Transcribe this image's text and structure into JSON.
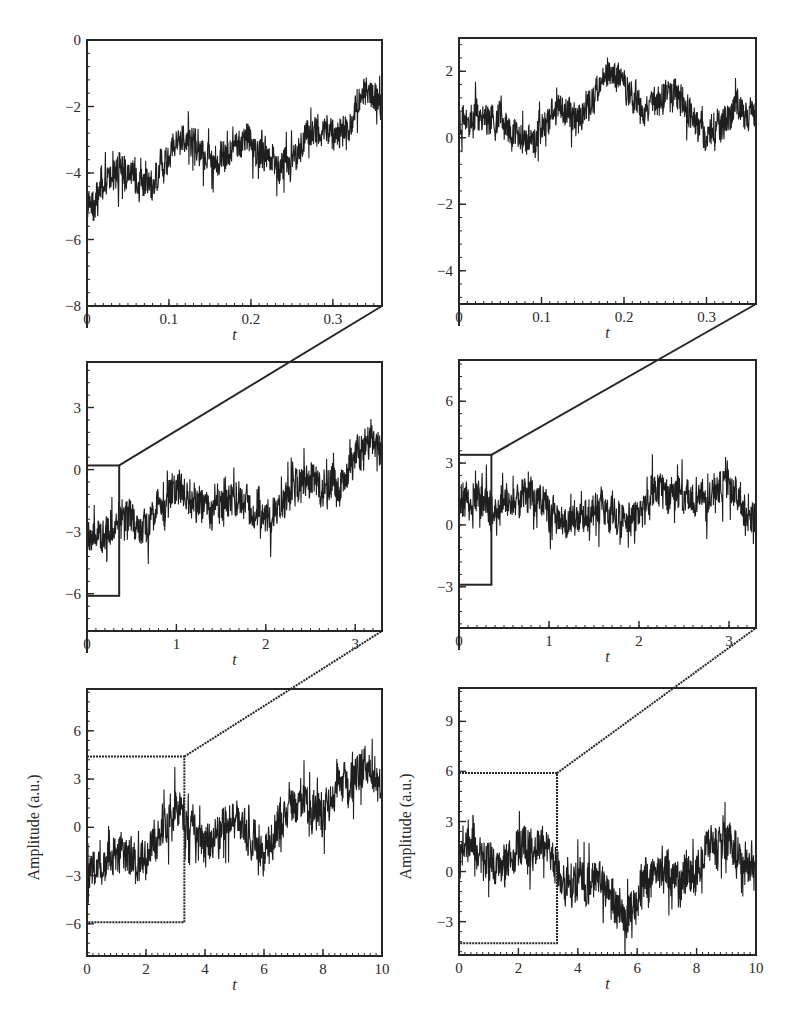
{
  "figure": {
    "line_color": "#1e1e1e",
    "frame_color": "#262626"
  },
  "chart_data": [
    {
      "id": "top-left",
      "type": "line",
      "column": "left",
      "row": "top",
      "title": "",
      "xlabel": "t",
      "ylabel": "",
      "xlim": [
        0,
        0.36
      ],
      "ylim": [
        -8,
        0
      ],
      "xticks": [
        0,
        0.1,
        0.2,
        0.3
      ],
      "xtick_labels": [
        "0",
        "0.1",
        "0.2",
        "0.3"
      ],
      "yticks": [
        -8,
        -6,
        -4,
        -2,
        0
      ],
      "ytick_labels": [
        "−8",
        "−6",
        "−4",
        "−2",
        "0"
      ],
      "x": [
        0,
        0.02,
        0.04,
        0.06,
        0.08,
        0.1,
        0.12,
        0.14,
        0.16,
        0.18,
        0.2,
        0.22,
        0.24,
        0.26,
        0.28,
        0.3,
        0.32,
        0.34,
        0.36
      ],
      "values": [
        -5.0,
        -4.5,
        -3.8,
        -4.2,
        -4.3,
        -3.4,
        -2.8,
        -3.3,
        -3.6,
        -3.1,
        -3.0,
        -3.6,
        -3.9,
        -3.2,
        -2.6,
        -2.7,
        -2.6,
        -1.4,
        -2.0
      ],
      "noise_amplitude": 0.9,
      "grid": false
    },
    {
      "id": "top-right",
      "type": "line",
      "column": "right",
      "row": "top",
      "xlabel": "t",
      "ylabel": "",
      "xlim": [
        0,
        0.36
      ],
      "ylim": [
        -5,
        3
      ],
      "xticks": [
        0,
        0.1,
        0.2,
        0.3
      ],
      "xtick_labels": [
        "0",
        "0.1",
        "0.2",
        "0.3"
      ],
      "yticks": [
        -4,
        -2,
        0,
        2
      ],
      "ytick_labels": [
        "−4",
        "−2",
        "0",
        "2"
      ],
      "x": [
        0,
        0.02,
        0.04,
        0.06,
        0.08,
        0.1,
        0.12,
        0.14,
        0.16,
        0.18,
        0.2,
        0.22,
        0.24,
        0.26,
        0.28,
        0.3,
        0.32,
        0.34,
        0.36
      ],
      "values": [
        0.4,
        0.6,
        0.5,
        0.3,
        -0.2,
        0.2,
        0.9,
        0.6,
        1.0,
        2.0,
        1.6,
        0.9,
        1.1,
        1.4,
        0.8,
        0.0,
        0.4,
        1.0,
        0.6
      ],
      "noise_amplitude": 0.9,
      "grid": false
    },
    {
      "id": "mid-left",
      "type": "line",
      "column": "left",
      "row": "middle",
      "xlabel": "t",
      "ylabel": "",
      "xlim": [
        0,
        3.3
      ],
      "ylim": [
        -7.8,
        5.2
      ],
      "xticks": [
        0,
        1,
        2,
        3
      ],
      "xtick_labels": [
        "0",
        "1",
        "2",
        "3"
      ],
      "yticks": [
        -6,
        -3,
        0,
        3
      ],
      "ytick_labels": [
        "−6",
        "−3",
        "0",
        "3"
      ],
      "x": [
        0,
        0.2,
        0.4,
        0.6,
        0.8,
        1.0,
        1.2,
        1.4,
        1.6,
        1.8,
        2.0,
        2.2,
        2.4,
        2.6,
        2.8,
        3.0,
        3.2,
        3.3
      ],
      "values": [
        -3.5,
        -3.0,
        -2.5,
        -2.8,
        -2.0,
        -0.8,
        -1.5,
        -2.0,
        -1.2,
        -1.5,
        -2.5,
        -1.5,
        -0.5,
        -0.8,
        -1.0,
        0.8,
        1.5,
        0.8
      ],
      "noise_amplitude": 1.6,
      "zoom_box": {
        "x0": 0,
        "x1": 0.36,
        "y0": -6.1,
        "y1": 0.2,
        "style": "solid"
      },
      "grid": false
    },
    {
      "id": "mid-right",
      "type": "line",
      "column": "right",
      "row": "middle",
      "xlabel": "t",
      "ylabel": "",
      "xlim": [
        0,
        3.3
      ],
      "ylim": [
        -5,
        8
      ],
      "xticks": [
        0,
        1,
        2,
        3
      ],
      "xtick_labels": [
        "0",
        "1",
        "2",
        "3"
      ],
      "yticks": [
        -3,
        0,
        3,
        6
      ],
      "ytick_labels": [
        "−3",
        "0",
        "3",
        "6"
      ],
      "x": [
        0,
        0.2,
        0.4,
        0.6,
        0.8,
        1.0,
        1.2,
        1.4,
        1.6,
        1.8,
        2.0,
        2.2,
        2.4,
        2.6,
        2.8,
        3.0,
        3.2,
        3.3
      ],
      "values": [
        0.8,
        1.2,
        0.6,
        1.2,
        1.6,
        0.6,
        0.0,
        0.6,
        0.8,
        0.2,
        0.3,
        1.8,
        1.4,
        1.2,
        1.5,
        1.8,
        0.6,
        0.2
      ],
      "noise_amplitude": 1.6,
      "zoom_box": {
        "x0": 0,
        "x1": 0.36,
        "y0": -2.9,
        "y1": 3.4,
        "style": "solid"
      },
      "grid": false
    },
    {
      "id": "bottom-left",
      "type": "line",
      "column": "left",
      "row": "bottom",
      "xlabel": "t",
      "ylabel": "Amplitude (a.u.)",
      "xlim": [
        0,
        10
      ],
      "ylim": [
        -8,
        8.6
      ],
      "xticks": [
        0,
        2,
        4,
        6,
        8,
        10
      ],
      "xtick_labels": [
        "0",
        "2",
        "4",
        "6",
        "8",
        "10"
      ],
      "yticks": [
        -6,
        -3,
        0,
        3,
        6
      ],
      "ytick_labels": [
        "−6",
        "−3",
        "0",
        "3",
        "6"
      ],
      "x": [
        0,
        0.5,
        1,
        1.5,
        2,
        2.5,
        3,
        3.5,
        4,
        4.5,
        5,
        5.5,
        6,
        6.5,
        7,
        7.5,
        8,
        8.5,
        9,
        9.5,
        10
      ],
      "values": [
        -3.0,
        -2.5,
        -1.2,
        -1.5,
        -2.2,
        0.0,
        1.0,
        0.2,
        -1.0,
        0.0,
        0.5,
        -0.8,
        -1.5,
        0.0,
        1.5,
        1.5,
        0.8,
        2.5,
        3.0,
        3.8,
        2.8
      ],
      "noise_amplitude": 2.4,
      "zoom_box": {
        "x0": 0,
        "x1": 3.3,
        "y0": -5.9,
        "y1": 4.4,
        "style": "dotted"
      },
      "grid": false
    },
    {
      "id": "bottom-right",
      "type": "line",
      "column": "right",
      "row": "bottom",
      "xlabel": "t",
      "ylabel": "Amplitude (a.u.)",
      "xlim": [
        0,
        10
      ],
      "ylim": [
        -5,
        11
      ],
      "xticks": [
        0,
        2,
        4,
        6,
        8,
        10
      ],
      "xtick_labels": [
        "0",
        "2",
        "4",
        "6",
        "8",
        "10"
      ],
      "yticks": [
        -3,
        0,
        3,
        6,
        9
      ],
      "ytick_labels": [
        "−3",
        "0",
        "3",
        "6",
        "9"
      ],
      "x": [
        0,
        0.5,
        1,
        1.5,
        2,
        2.5,
        3,
        3.5,
        4,
        4.5,
        5,
        5.5,
        6,
        6.5,
        7,
        7.5,
        8,
        8.5,
        9,
        9.5,
        10
      ],
      "values": [
        1.0,
        1.5,
        0.5,
        0.3,
        1.5,
        1.8,
        1.5,
        -0.5,
        -0.8,
        0.0,
        -1.0,
        -2.5,
        -2.2,
        -0.2,
        0.0,
        -0.5,
        0.2,
        1.5,
        1.8,
        0.5,
        0.8
      ],
      "noise_amplitude": 2.4,
      "zoom_box": {
        "x0": 0,
        "x1": 3.3,
        "y0": -4.3,
        "y1": 5.9,
        "style": "dotted"
      },
      "grid": false
    }
  ]
}
